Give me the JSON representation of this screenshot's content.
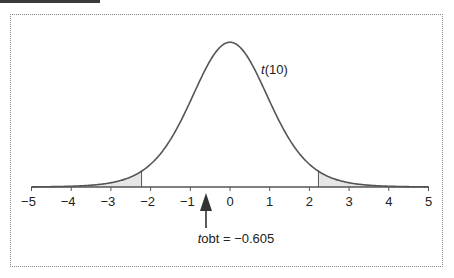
{
  "chart_data": {
    "type": "area",
    "title": "",
    "distribution": "t",
    "df": 10,
    "curve_label_italic": "t",
    "curve_label_rest": "(10)",
    "xlabel": "",
    "ylabel": "",
    "xlim": [
      -5,
      5
    ],
    "x_ticks": [
      -5,
      -4,
      -3,
      -2,
      -1,
      0,
      1,
      2,
      3,
      4,
      5
    ],
    "x_tick_labels": [
      "−5",
      "−4",
      "−3",
      "−2",
      "−1",
      "0",
      "1",
      "2",
      "3",
      "4",
      "5"
    ],
    "critical_values": [
      -2.228,
      2.228
    ],
    "shaded_regions": [
      {
        "from": -5,
        "to": -2.228,
        "label": "lower rejection region"
      },
      {
        "from": 2.228,
        "to": 5,
        "label": "upper rejection region"
      }
    ],
    "annotation": {
      "italic": "t",
      "rest": "obt = −0.605",
      "value": -0.605
    },
    "grid": false,
    "legend": "none"
  }
}
